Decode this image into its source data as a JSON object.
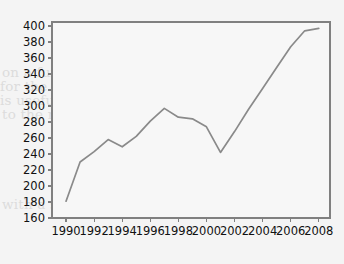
{
  "chart_data": {
    "type": "line",
    "title": "",
    "subtitle": "",
    "xlabel": "",
    "ylabel": "",
    "xlim": [
      1989.0,
      2008.8
    ],
    "ylim": [
      160,
      405
    ],
    "grid": false,
    "legend": null,
    "y_ticks": [
      160,
      180,
      200,
      220,
      240,
      260,
      280,
      300,
      320,
      340,
      360,
      380,
      400
    ],
    "x_ticks": [
      1990,
      1992,
      1994,
      1996,
      1998,
      2000,
      2002,
      2004,
      2006,
      2008
    ],
    "x_tick_labels": [
      "1990",
      "1992",
      "1994",
      "1996",
      "1998",
      "2000",
      "2002",
      "2004",
      "2006",
      "2008"
    ],
    "y_tick_labels": [
      "160",
      "180",
      "200",
      "220",
      "240",
      "260",
      "280",
      "300",
      "320",
      "340",
      "360",
      "380",
      "400"
    ],
    "series": [
      {
        "name": "series-1",
        "color": "#8a8a8a",
        "x": [
          1990,
          1991,
          1992,
          1993,
          1994,
          1995,
          1996,
          1997,
          1998,
          1999,
          2000,
          2001,
          2002,
          2003,
          2004,
          2005,
          2006,
          2007,
          2008
        ],
        "values": [
          181,
          230,
          243,
          258,
          249,
          262,
          281,
          297,
          286,
          284,
          274,
          242,
          268,
          296,
          322,
          348,
          374,
          394,
          397
        ]
      }
    ]
  },
  "ghost_text": {
    "lines": [
      "of the production and comparison",
      "on a functional arrangement",
      "for the new research and services",
      "is useful and shall not obstruct",
      "to the regional provider",
      "additional control from this year",
      "with a summary of the continued"
    ]
  },
  "colors": {
    "line": "#8a8a8a",
    "axis": "#808080",
    "text": "#111111",
    "background": "#f4f4f4",
    "plot_background": "#f7f7f7"
  }
}
